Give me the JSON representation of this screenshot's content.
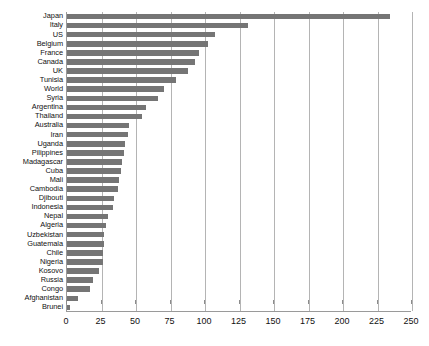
{
  "chart_data": {
    "type": "bar",
    "orientation": "horizontal",
    "title": "",
    "subtitle": "",
    "xlabel": "",
    "ylabel": "",
    "xlim": [
      0,
      250
    ],
    "xticks": [
      0,
      25,
      50,
      75,
      100,
      125,
      150,
      175,
      200,
      225,
      250
    ],
    "tick_labels": [
      "0",
      "25",
      "50",
      "75",
      "100",
      "125",
      "150",
      "175",
      "200",
      "225",
      "250"
    ],
    "grid": "vertical",
    "legend": "none",
    "bar_color": "#757575",
    "grid_color": "#b4b4b4",
    "axis_color": "#9a9a9a",
    "categories": [
      "Japan",
      "Italy",
      "US",
      "Belgium",
      "France",
      "Canada",
      "UK",
      "Tunisia",
      "World",
      "Syria",
      "Argentina",
      "Thailand",
      "Australia",
      "Iran",
      "Uganda",
      "Pilippines",
      "Madagascar",
      "Cuba",
      "Mali",
      "Cambodia",
      "Djibouti",
      "Indonesia",
      "Nepal",
      "Algeria",
      "Uzbekistan",
      "Guatemala",
      "Chile",
      "Nigeria",
      "Kosovo",
      "Russia",
      "Congo",
      "Afghanistan",
      "Brunei"
    ],
    "values": [
      234,
      131,
      107,
      102,
      96,
      93,
      88,
      79,
      70,
      66,
      57,
      54,
      45,
      44,
      42,
      41,
      40,
      39,
      38,
      37,
      34,
      33,
      30,
      28,
      27,
      27,
      26,
      26,
      23,
      19,
      17,
      8,
      2
    ]
  }
}
